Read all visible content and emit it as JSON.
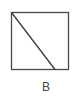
{
  "figure": {
    "label": "B",
    "stroke_color": "#4a4a4a",
    "square": {
      "x": 11,
      "y": 12,
      "width": 57,
      "height": 57
    },
    "diagonal": {
      "x1": 11,
      "y1": 12,
      "x2": 55,
      "y2": 69
    }
  }
}
